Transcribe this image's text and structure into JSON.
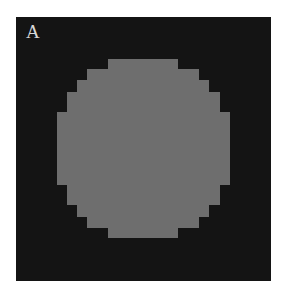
{
  "panel": {
    "label": "A",
    "frame_color": "#141414",
    "disk_color": "#6e6e6e",
    "background_color": "#ffffff"
  },
  "disk_rows": [
    {
      "top": 59,
      "bottom": 69,
      "left": 108,
      "right": 178
    },
    {
      "top": 69,
      "bottom": 80,
      "left": 87,
      "right": 199
    },
    {
      "top": 80,
      "bottom": 92,
      "left": 77,
      "right": 209
    },
    {
      "top": 92,
      "bottom": 112,
      "left": 67,
      "right": 220
    },
    {
      "top": 112,
      "bottom": 185,
      "left": 57,
      "right": 230
    },
    {
      "top": 185,
      "bottom": 205,
      "left": 67,
      "right": 220
    },
    {
      "top": 205,
      "bottom": 217,
      "left": 77,
      "right": 209
    },
    {
      "top": 217,
      "bottom": 228,
      "left": 87,
      "right": 199
    },
    {
      "top": 228,
      "bottom": 238,
      "left": 108,
      "right": 178
    }
  ]
}
